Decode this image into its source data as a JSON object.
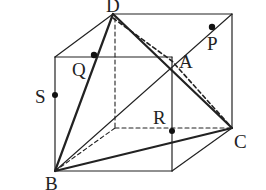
{
  "diagram": {
    "colors": {
      "stroke": "#222222",
      "background": "#ffffff"
    },
    "vertices": {
      "D": {
        "label": "D",
        "x": 113,
        "y": 14
      },
      "backTopRight": {
        "x": 232,
        "y": 14
      },
      "frontTopLeft": {
        "x": 55,
        "y": 57
      },
      "A": {
        "label": "A",
        "x": 172,
        "y": 57
      },
      "backBottomLeft": {
        "x": 115,
        "y": 128
      },
      "C": {
        "label": "C",
        "x": 232,
        "y": 128
      },
      "B": {
        "label": "B",
        "x": 55,
        "y": 171
      },
      "frontBottomRight": {
        "x": 172,
        "y": 171
      }
    },
    "points": {
      "P": {
        "label": "P",
        "x": 212,
        "y": 27
      },
      "Q": {
        "label": "Q",
        "x": 94,
        "y": 55
      },
      "S": {
        "label": "S",
        "x": 55,
        "y": 95
      },
      "R": {
        "label": "R",
        "x": 172,
        "y": 131
      }
    },
    "labels": {
      "D": "D",
      "A": "A",
      "P": "P",
      "Q": "Q",
      "S": "S",
      "R": "R",
      "C": "C",
      "B": "B"
    }
  }
}
